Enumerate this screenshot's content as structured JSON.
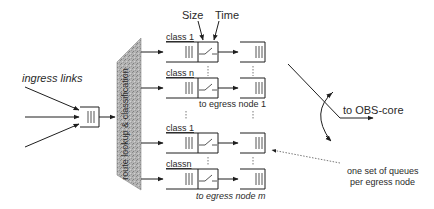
{
  "diagram": {
    "type": "switch-architecture",
    "labels": {
      "ingress": "ingress links",
      "classifier": "route lookup & classification",
      "size": "Size",
      "time": "Time",
      "class1_top": "class 1",
      "classn_top": "class n",
      "egress1": "to egress node 1",
      "class1_bottom": "class 1",
      "classn_bottom": "classn",
      "egressm": "to egress node m",
      "obs_core": "to OBS-core",
      "note_line1": "one set of queues",
      "note_line2": "per egress node"
    },
    "nodes": [
      {
        "id": "ingress-buffer",
        "kind": "queue"
      },
      {
        "id": "classifier",
        "kind": "processing-block"
      },
      {
        "id": "queue-egress1-class1",
        "kind": "queue-with-switch"
      },
      {
        "id": "queue-egress1-classn",
        "kind": "queue-with-switch"
      },
      {
        "id": "queue-egressm-class1",
        "kind": "queue-with-switch"
      },
      {
        "id": "queue-egressm-classn",
        "kind": "queue-with-switch"
      },
      {
        "id": "out-egress1-class1",
        "kind": "queue"
      },
      {
        "id": "out-egress1-classn",
        "kind": "queue"
      },
      {
        "id": "out-egressm-class1",
        "kind": "queue"
      },
      {
        "id": "out-egressm-classn",
        "kind": "queue"
      }
    ],
    "colors": {
      "line": "#1e1e1e",
      "text": "#2a2a2a",
      "classifier_fill": "#a9a9a9"
    }
  }
}
